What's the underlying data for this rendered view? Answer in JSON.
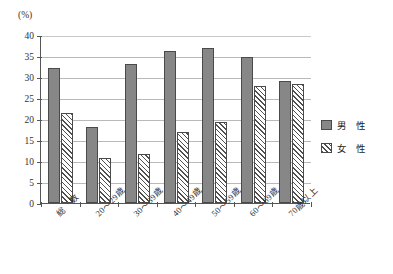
{
  "chart_data": {
    "type": "bar",
    "title": "",
    "xlabel": "",
    "ylabel": "",
    "unit_label": "(%)",
    "ylim": [
      0,
      40
    ],
    "ytick_step": 5,
    "yticks": [
      "40",
      "35",
      "30",
      "25",
      "20",
      "15",
      "10",
      "5",
      "0"
    ],
    "grid": true,
    "legend_position": "right",
    "categories": [
      "総　数",
      "20〜29歳",
      "30〜39歳",
      "40〜49歳",
      "50〜59歳",
      "60〜69歳",
      "70歳以上"
    ],
    "series": [
      {
        "name": "男　性",
        "key": "male",
        "style": "solid-gray",
        "color": "#878787",
        "values": [
          32.2,
          18.0,
          33.0,
          36.3,
          37.0,
          34.8,
          29.0
        ]
      },
      {
        "name": "女　性",
        "key": "female",
        "style": "diagonal-hatch",
        "color": "#ffffff",
        "values": [
          21.5,
          10.7,
          11.6,
          16.8,
          19.4,
          27.8,
          28.3
        ]
      }
    ]
  },
  "legend": {
    "items": [
      {
        "label": "男　性"
      },
      {
        "label": "女　性"
      }
    ]
  }
}
